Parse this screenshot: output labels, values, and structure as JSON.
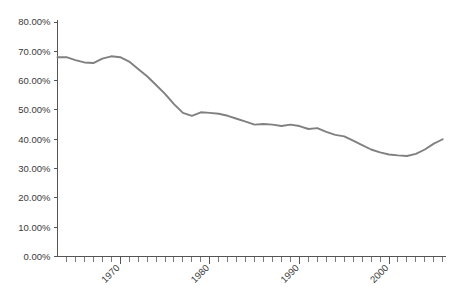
{
  "chart_data": {
    "type": "line",
    "title": "",
    "subtitle": "",
    "xlabel": "",
    "ylabel": "",
    "xlim": [
      1963,
      2007
    ],
    "ylim": [
      0,
      80
    ],
    "grid": false,
    "legend": null,
    "line_color": "#808080",
    "axis_color": "#555555",
    "y_tick_labels": [
      "0.00%",
      "10.00%",
      "20.00%",
      "30.00%",
      "40.00%",
      "50.00%",
      "60.00%",
      "70.00%",
      "80.00%"
    ],
    "y_tick_values": [
      0,
      10,
      20,
      30,
      40,
      50,
      60,
      70,
      80
    ],
    "x_tick_labels": [
      "1970",
      "1980",
      "1990",
      "2000"
    ],
    "x_tick_values": [
      1970,
      1980,
      1990,
      2000
    ],
    "x_minor_tick_step": 1,
    "series": [
      {
        "name": "",
        "x": [
          1963,
          1964,
          1965,
          1966,
          1967,
          1968,
          1969,
          1970,
          1971,
          1972,
          1973,
          1974,
          1975,
          1976,
          1977,
          1978,
          1979,
          1980,
          1981,
          1982,
          1983,
          1984,
          1985,
          1986,
          1987,
          1988,
          1989,
          1990,
          1991,
          1992,
          1993,
          1994,
          1995,
          1996,
          1997,
          1998,
          1999,
          2000,
          2001,
          2002,
          2003,
          2004,
          2005,
          2006
        ],
        "values": [
          68.0,
          68.0,
          67.0,
          66.2,
          66.0,
          67.5,
          68.3,
          68.0,
          66.5,
          64.0,
          61.5,
          58.5,
          55.5,
          52.0,
          49.0,
          48.0,
          49.2,
          49.0,
          48.7,
          48.0,
          47.0,
          46.0,
          45.0,
          45.2,
          45.0,
          44.5,
          45.0,
          44.5,
          43.5,
          43.8,
          42.5,
          41.5,
          41.0,
          39.5,
          38.0,
          36.5,
          35.5,
          34.8,
          34.5,
          34.3,
          35.0,
          36.5,
          38.5,
          40.0
        ]
      }
    ]
  }
}
